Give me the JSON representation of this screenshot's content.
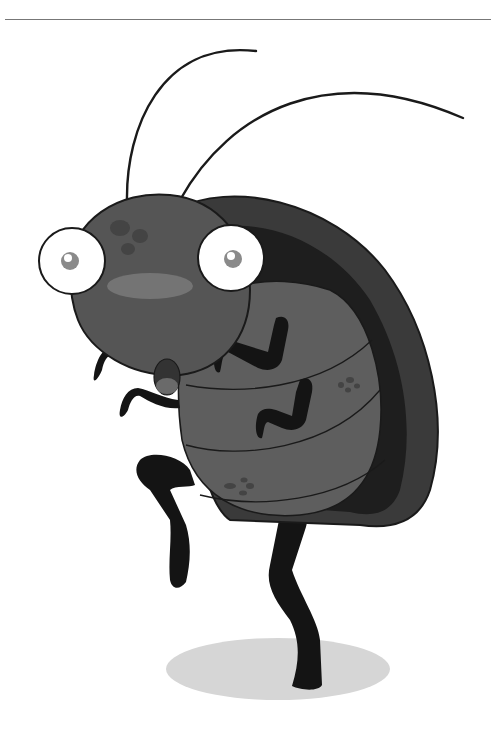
{
  "illustration": {
    "subject": "cartoon cockroach",
    "colors": {
      "background": "#ffffff",
      "rule": "#777777",
      "outline": "#1a1a1a",
      "head": "#555555",
      "head_highlight": "#747474",
      "head_spots": "#444444",
      "shell_outer": "#3a3a3a",
      "shell_inner_band": "#1e1e1e",
      "belly": "#5e5e5e",
      "belly_lower": "#555555",
      "legs": "#141414",
      "eye_white": "#ffffff",
      "pupil": "#8a8a8a",
      "shadow": "#d6d6d6"
    }
  }
}
